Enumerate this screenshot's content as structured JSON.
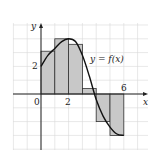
{
  "chart_data": {
    "type": "bar",
    "subtype": "riemann-sum-right-endpoints-with-curve",
    "title": "",
    "xlabel": "x",
    "ylabel": "y",
    "curve_label": "y = f(x)",
    "x_tick_labels": [
      "0",
      "2",
      "6"
    ],
    "y_tick_labels": [
      "2"
    ],
    "xlim": [
      -2,
      7.5
    ],
    "ylim": [
      -4,
      5
    ],
    "grid": true,
    "rectangles": [
      {
        "x0": 0,
        "x1": 1,
        "height": 3.1
      },
      {
        "x0": 1,
        "x1": 2,
        "height": 4.0
      },
      {
        "x0": 2,
        "x1": 3,
        "height": 3.6
      },
      {
        "x0": 3,
        "x1": 4,
        "height": 0.4
      },
      {
        "x0": 4,
        "x1": 5,
        "height": -2.0
      },
      {
        "x0": 5,
        "x1": 6,
        "height": -3.0
      }
    ],
    "curve_points": [
      {
        "x": 0,
        "y": 2.0
      },
      {
        "x": 0.5,
        "y": 2.8
      },
      {
        "x": 1,
        "y": 3.3
      },
      {
        "x": 1.5,
        "y": 3.8
      },
      {
        "x": 2,
        "y": 4.0
      },
      {
        "x": 2.5,
        "y": 3.8
      },
      {
        "x": 3,
        "y": 2.8
      },
      {
        "x": 3.5,
        "y": 1.3
      },
      {
        "x": 4,
        "y": -0.4
      },
      {
        "x": 4.5,
        "y": -1.6
      },
      {
        "x": 5,
        "y": -2.4
      },
      {
        "x": 5.5,
        "y": -2.9
      },
      {
        "x": 6,
        "y": -3.0
      }
    ]
  },
  "colors": {
    "rect_fill": "#c8c8c8",
    "rect_stroke": "#333333",
    "grid": "#d8d8d8",
    "axis": "#222222",
    "curve": "#111111"
  }
}
